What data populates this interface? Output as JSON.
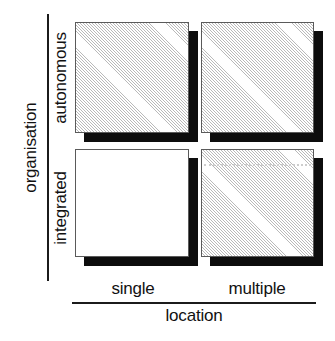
{
  "chart_data": {
    "type": "heatmap",
    "title": "",
    "xlabel": "location",
    "ylabel": "organisation",
    "x_categories": [
      "single",
      "multiple"
    ],
    "y_categories": [
      "autonomous",
      "integrated"
    ],
    "grid": false,
    "legend": "none",
    "cells": [
      {
        "id": "autonomous-single",
        "row": "autonomous",
        "column": "single",
        "fill": "hatched",
        "shadow": true,
        "label": ""
      },
      {
        "id": "autonomous-multiple",
        "row": "autonomous",
        "column": "multiple",
        "fill": "hatched",
        "shadow": true,
        "label": ""
      },
      {
        "id": "integrated-single",
        "row": "integrated",
        "column": "single",
        "fill": "plain",
        "shadow": true,
        "label": ""
      },
      {
        "id": "integrated-multiple",
        "row": "integrated",
        "column": "multiple",
        "fill": "hatched",
        "shadow": true,
        "divider": "dotted",
        "label": ""
      }
    ],
    "colors": {
      "hatch": "#b9b9b9",
      "plain": "#ffffff",
      "shadow": "#0d0d0d",
      "border": "#5a5a5a",
      "axis": "#1b1b1b",
      "text": "#111111"
    }
  },
  "axes": {
    "y": {
      "title": "organisation",
      "ticks": [
        {
          "label": "autonomous"
        },
        {
          "label": "integrated"
        }
      ]
    },
    "x": {
      "title": "location",
      "ticks": [
        {
          "label": "single"
        },
        {
          "label": "multiple"
        }
      ]
    }
  }
}
